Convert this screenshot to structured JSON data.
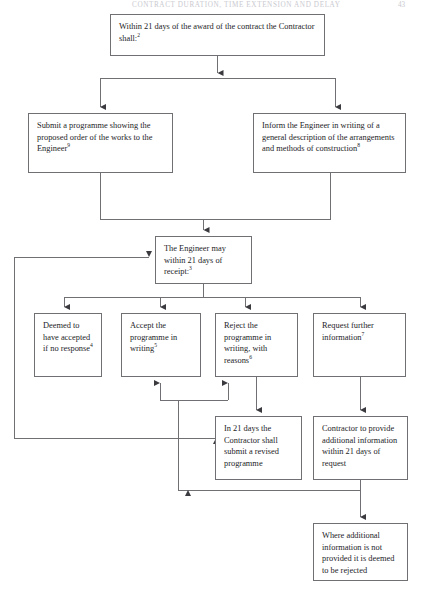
{
  "page": {
    "running_head": "CONTRACT DURATION, TIME EXTENSION AND DELAY",
    "folio": "43",
    "width": 426,
    "height": 593,
    "background": "#ffffff",
    "line_color": "#6f6f74",
    "text_color": "#1d1d1f"
  },
  "diagram": {
    "type": "flowchart",
    "nodes": [
      {
        "id": "award",
        "name": "within-21-days-of-award",
        "text": "Within 21 days of the award of the contract the Contractor shall:",
        "superscript": "2",
        "x": 110,
        "y": 14,
        "w": 215,
        "h": 42
      },
      {
        "id": "submit-programme",
        "name": "submit-programme",
        "text": "Submit a programme showing the proposed order of the works to the Engineer",
        "superscript": "9",
        "x": 28,
        "y": 113,
        "w": 145,
        "h": 60
      },
      {
        "id": "inform-engineer",
        "name": "inform-engineer",
        "text": "Inform the Engineer in writing of a general description of the arrangements and methods of construction",
        "superscript": "8",
        "x": 253,
        "y": 113,
        "w": 153,
        "h": 60
      },
      {
        "id": "engineer-may",
        "name": "engineer-may-within-21-days",
        "text": "The Engineer may within 21 days of receipt:",
        "superscript": "3",
        "x": 155,
        "y": 236,
        "w": 97,
        "h": 48
      },
      {
        "id": "deemed-accepted",
        "name": "deemed-to-have-accepted",
        "text": "Deemed to have accepted if no response",
        "superscript": "4",
        "x": 34,
        "y": 313,
        "w": 68,
        "h": 64
      },
      {
        "id": "accept-programme",
        "name": "accept-the-programme",
        "text": "Accept the programme in writing",
        "superscript": "5",
        "x": 121,
        "y": 313,
        "w": 80,
        "h": 64
      },
      {
        "id": "reject-programme",
        "name": "reject-the-programme",
        "text": "Reject the programme in writing, with reasons",
        "superscript": "6",
        "x": 215,
        "y": 313,
        "w": 83,
        "h": 64
      },
      {
        "id": "request-information",
        "name": "request-further-information",
        "text": "Request further information",
        "superscript": "7",
        "x": 313,
        "y": 313,
        "w": 93,
        "h": 64
      },
      {
        "id": "revised-programme",
        "name": "submit-revised-programme",
        "text": "In 21 days the Contractor shall submit a revised programme",
        "superscript": "",
        "x": 215,
        "y": 416,
        "w": 87,
        "h": 64
      },
      {
        "id": "provide-information",
        "name": "contractor-provide-additional-information",
        "text": "Contractor to provide additional information within 21 days of request",
        "superscript": "",
        "x": 313,
        "y": 416,
        "w": 95,
        "h": 64
      },
      {
        "id": "deemed-rejected",
        "name": "deemed-to-be-rejected",
        "text": "Where additional information is not provided it is deemed to be rejected",
        "superscript": "",
        "x": 313,
        "y": 523,
        "w": 95,
        "h": 58
      }
    ],
    "edges": [
      {
        "id": "e1",
        "name": "edge-award-to-split",
        "from": "award",
        "to": "split-bar-1",
        "arrow": true
      },
      {
        "id": "e2",
        "name": "edge-split-to-submit",
        "from": "split-bar-1",
        "to": "submit-programme",
        "arrow": true
      },
      {
        "id": "e3",
        "name": "edge-split-to-inform",
        "from": "split-bar-1",
        "to": "inform-engineer",
        "arrow": true
      },
      {
        "id": "e4",
        "name": "edge-submit-to-engineer",
        "from": "submit-programme",
        "to": "engineer-may",
        "arrow": true
      },
      {
        "id": "e5",
        "name": "edge-inform-to-engineer",
        "from": "inform-engineer",
        "to": "engineer-may",
        "arrow": true
      },
      {
        "id": "e6",
        "name": "edge-engineer-to-deemed",
        "from": "engineer-may",
        "to": "deemed-accepted",
        "arrow": true
      },
      {
        "id": "e7",
        "name": "edge-engineer-to-accept",
        "from": "engineer-may",
        "to": "accept-programme",
        "arrow": true
      },
      {
        "id": "e8",
        "name": "edge-engineer-to-reject",
        "from": "engineer-may",
        "to": "reject-programme",
        "arrow": true
      },
      {
        "id": "e9",
        "name": "edge-engineer-to-request",
        "from": "engineer-may",
        "to": "request-information",
        "arrow": true
      },
      {
        "id": "e10",
        "name": "edge-reject-to-revised",
        "from": "reject-programme",
        "to": "revised-programme",
        "arrow": true
      },
      {
        "id": "e11",
        "name": "edge-request-to-provide",
        "from": "request-information",
        "to": "provide-information",
        "arrow": true
      },
      {
        "id": "e12",
        "name": "edge-revised-to-accept-loop",
        "from": "revised-programme",
        "to": "accept-programme",
        "arrow": true
      },
      {
        "id": "e13",
        "name": "edge-revised-to-engineer-loop",
        "from": "revised-programme",
        "to": "engineer-may",
        "arrow": true
      },
      {
        "id": "e14",
        "name": "edge-provide-to-revised-loop",
        "from": "provide-information",
        "to": "revised-programme",
        "arrow": true
      },
      {
        "id": "e15",
        "name": "edge-provide-to-reject-loop",
        "from": "provide-information",
        "to": "reject-programme",
        "arrow": true
      },
      {
        "id": "e16",
        "name": "edge-provide-to-deemed-rejected",
        "from": "provide-information",
        "to": "deemed-rejected",
        "arrow": true
      }
    ]
  }
}
